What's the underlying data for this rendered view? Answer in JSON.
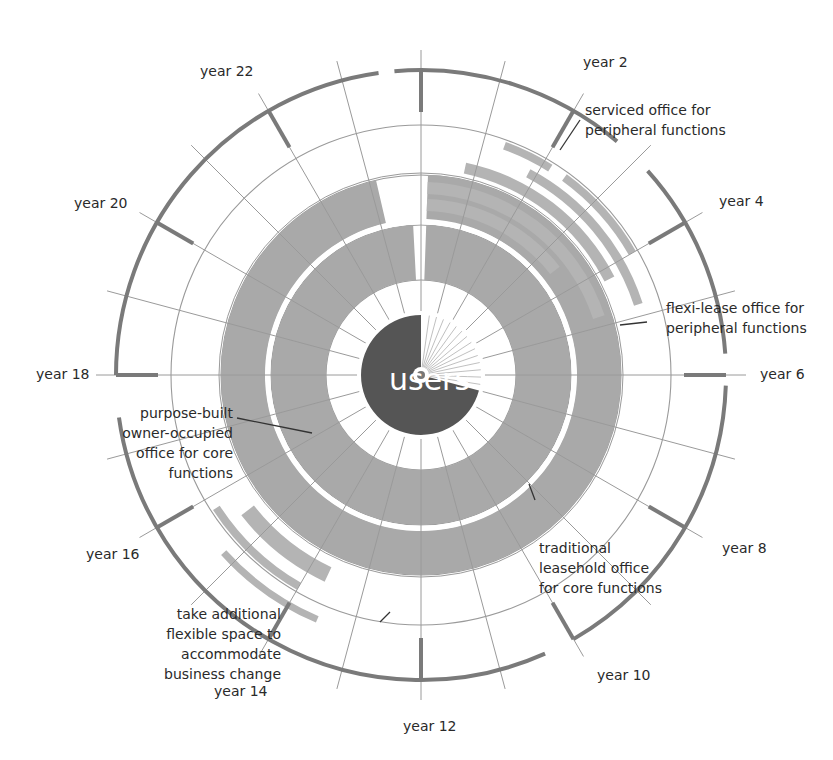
{
  "diagram": {
    "center_label": "users",
    "colors": {
      "grid": "#9a9a9a",
      "outer_ring": "#7a7a7a",
      "core_fill": "#a9a9a9",
      "flex_fill": "#b4b4b4",
      "users_disc": "#555555",
      "text": "#2a2a2a"
    },
    "year_labels": [
      {
        "label": "year 2",
        "year": 2
      },
      {
        "label": "year 4",
        "year": 4
      },
      {
        "label": "year 6",
        "year": 6
      },
      {
        "label": "year 8",
        "year": 8
      },
      {
        "label": "year 10",
        "year": 10
      },
      {
        "label": "year 12",
        "year": 12
      },
      {
        "label": "year 14",
        "year": 14
      },
      {
        "label": "year 16",
        "year": 16
      },
      {
        "label": "year 18",
        "year": 18
      },
      {
        "label": "year 20",
        "year": 20
      },
      {
        "label": "year 22",
        "year": 22
      }
    ],
    "annotations": {
      "serviced": [
        "serviced office for",
        "peripheral functions"
      ],
      "flexi": [
        "flexi-lease office for",
        "peripheral functions"
      ],
      "purpose_built": [
        "purpose-built",
        "owner-occupied",
        "office for core",
        "functions"
      ],
      "traditional": [
        "traditional",
        "leasehold office",
        "for core functions"
      ],
      "additional": [
        "take additional",
        "flexible space to",
        "accommodate",
        "business change"
      ]
    }
  }
}
